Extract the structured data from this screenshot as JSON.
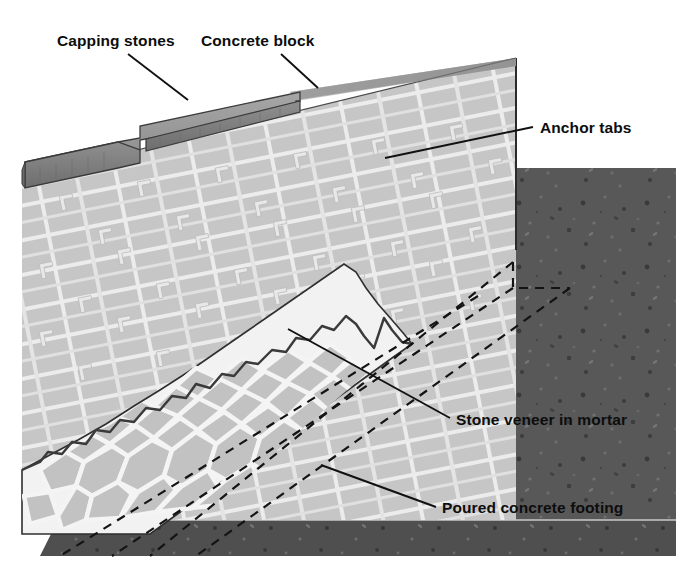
{
  "figure": {
    "background_color": "#ffffff",
    "callouts": [
      {
        "id": "capping-stones",
        "label": "Capping stones",
        "text_x": 57,
        "text_y": 46,
        "leader": [
          [
            128,
            54
          ],
          [
            188,
            100
          ]
        ]
      },
      {
        "id": "concrete-block",
        "label": "Concrete block",
        "text_x": 201,
        "text_y": 46,
        "leader": [
          [
            281,
            54
          ],
          [
            318,
            88
          ]
        ]
      },
      {
        "id": "anchor-tabs",
        "label": "Anchor tabs",
        "text_x": 540,
        "text_y": 133,
        "leader": [
          [
            533,
            127
          ],
          [
            385,
            158
          ]
        ]
      },
      {
        "id": "stone-veneer-in-mortar",
        "label": "Stone veneer in mortar",
        "text_x": 456,
        "text_y": 425,
        "leader": [
          [
            450,
            418
          ],
          [
            288,
            329
          ]
        ]
      },
      {
        "id": "poured-concrete-footing",
        "label": "Poured concrete footing",
        "text_x": 442,
        "text_y": 513,
        "leader": [
          [
            436,
            507
          ],
          [
            321,
            465
          ]
        ]
      }
    ],
    "colors": {
      "block_face": "#c6c6c6",
      "block_mortar": "#ededed",
      "block_top": "#b0b0b0",
      "capping_top": "#9a9a9a",
      "capping_edge": "#7d7d7d",
      "soil": "#585858",
      "footing": "#4f4f4f",
      "veneer_stone": "#c0c0c0",
      "veneer_mortar": "#f2f2f2",
      "outline": "#2b2b2b",
      "leader_line": "#111111",
      "text": "#0d0d0d"
    },
    "geometry": {
      "illustration_left": 22,
      "illustration_right": 676,
      "illustration_top": 58,
      "illustration_bottom": 556,
      "wall_right_edge_x": 516,
      "soil_top_y": 168,
      "footing_line_y": 520
    }
  }
}
